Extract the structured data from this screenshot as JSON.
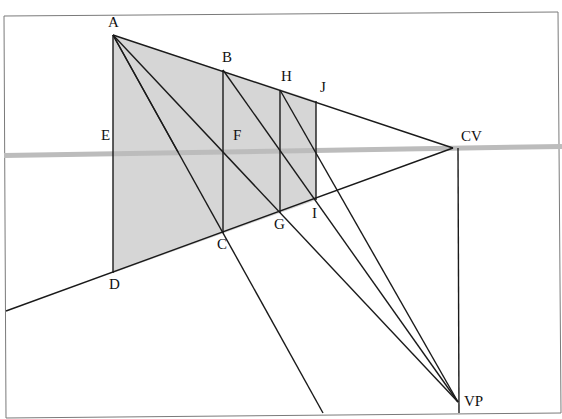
{
  "diagram": {
    "type": "perspective-construction",
    "colors": {
      "background": "#ffffff",
      "frame": "#6a6a6a",
      "line": "#1a1a1a",
      "shading": "#d6d6d6",
      "horizon": "#bcbcbc"
    },
    "labels": {
      "A": "A",
      "B": "B",
      "H": "H",
      "J": "J",
      "E": "E",
      "F": "F",
      "CV": "CV",
      "C": "C",
      "G": "G",
      "I": "I",
      "D": "D",
      "VP": "VP"
    },
    "points": {
      "A": [
        113,
        35
      ],
      "B": [
        223,
        70
      ],
      "H": [
        280,
        90
      ],
      "J": [
        316,
        101
      ],
      "E": [
        113,
        154
      ],
      "F": [
        223,
        152
      ],
      "C": [
        223,
        233
      ],
      "G": [
        280,
        213
      ],
      "I": [
        316,
        200
      ],
      "D": [
        113,
        273
      ],
      "CV": [
        453,
        148
      ],
      "VP": [
        458,
        402
      ]
    },
    "horizon_label": "horizon line"
  }
}
